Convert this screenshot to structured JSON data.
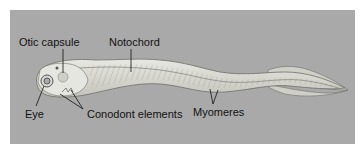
{
  "figure": {
    "colors": {
      "background": "#a9a9a9",
      "body_fill": "#dcdcd6",
      "body_outline": "#7a7a74",
      "label_text": "#111111"
    },
    "labels": [
      {
        "id": "otic-capsule",
        "text": "Otic capsule"
      },
      {
        "id": "notochord",
        "text": "Notochord"
      },
      {
        "id": "eye",
        "text": "Eye"
      },
      {
        "id": "conodont-elements",
        "text": "Conodont elements"
      },
      {
        "id": "myomeres",
        "text": "Myomeres"
      }
    ]
  }
}
